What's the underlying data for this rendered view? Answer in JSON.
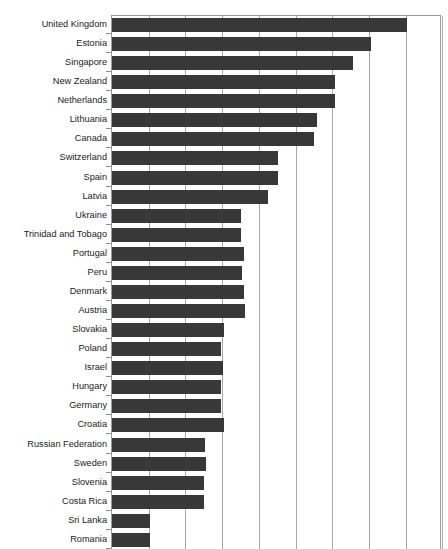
{
  "chart": {
    "title": "",
    "type": "bar",
    "orientation": "horizontal"
  },
  "chart_data": {
    "type": "bar",
    "orientation": "horizontal",
    "title": "",
    "subtitle": "",
    "xlabel": "",
    "ylabel": "",
    "grid": true,
    "legend": false,
    "legend_position": "none",
    "xlim": [
      0,
      9
    ],
    "x_tick_count": 10,
    "bar_color": "#383838",
    "note": "Value axis is unlabeled in the visible crop; values are expressed in gridline units where one interval = 1.0.",
    "categories": [
      "United Kingdom",
      "Estonia",
      "Singapore",
      "New Zealand",
      "Netherlands",
      "Lithuania",
      "Canada",
      "Switzerland",
      "Spain",
      "Latvia",
      "Ukraine",
      "Trinidad and Tobago",
      "Portugal",
      "Peru",
      "Denmark",
      "Austria",
      "Slovakia",
      "Poland",
      "Israel",
      "Hungary",
      "Germany",
      "Croatia",
      "Russian Federation",
      "Sweden",
      "Slovenia",
      "Costa Rica",
      "Sri Lanka",
      "Romania"
    ],
    "values": [
      8.03,
      7.06,
      6.58,
      6.08,
      6.08,
      5.59,
      5.51,
      4.51,
      4.51,
      4.24,
      3.51,
      3.51,
      3.6,
      3.54,
      3.6,
      3.62,
      3.06,
      2.97,
      3.02,
      2.97,
      2.97,
      3.06,
      2.54,
      2.56,
      2.51,
      2.51,
      1.04,
      1.04
    ]
  },
  "axis": {
    "tick_stub_color": "#8d8d8d",
    "gridline_color": "#a8a8a8",
    "border_color": "#9a9a9a"
  }
}
